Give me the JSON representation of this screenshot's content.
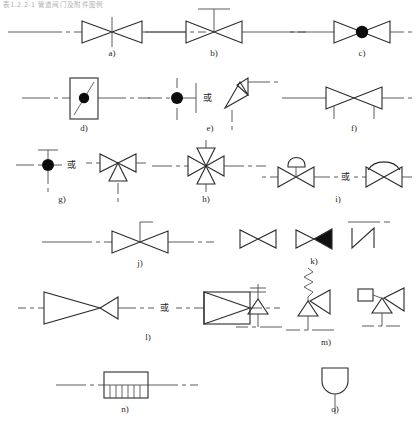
{
  "page": {
    "header_text": "表1.2.2-1  管道阀门及附件图例",
    "background": "#ffffff",
    "line_color": "#4a4a4a",
    "symbol_color": "#2b2b2b",
    "fill_color": "#111111",
    "width": 416,
    "height": 428
  },
  "or_label": "或",
  "items": [
    {
      "key": "a",
      "caption": "a)",
      "symbol_name": "globe-valve-plain",
      "description": "双三角阀门符号，中心交叉，带竖向阀杆线",
      "has_or": false,
      "variants": 1
    },
    {
      "key": "b",
      "caption": "b)",
      "symbol_name": "gate-valve-with-handwheel-stem",
      "description": "双三角阀门，顶部竖杆加横向手轮横线（T形）",
      "has_or": false,
      "variants": 1
    },
    {
      "key": "c",
      "caption": "c)",
      "symbol_name": "valve-with-solid-circle-center",
      "description": "双三角阀门，中心为实心圆点",
      "has_or": false,
      "variants": 1
    },
    {
      "key": "d",
      "caption": "d)",
      "symbol_name": "rectangular-body-valve-with-disc",
      "description": "竖长方形阀体，内有斜线与实心圆点",
      "has_or": false,
      "variants": 1
    },
    {
      "key": "e",
      "caption": "e)",
      "symbol_name": "plug-valve-or-angle-valve",
      "description": "实心圆点配竖杆与竖线 或 直角转角阀（两三角成直角）",
      "has_or": true,
      "variants": 2
    },
    {
      "key": "f",
      "caption": "f)",
      "symbol_name": "valve-with-two-down-legs",
      "description": "双三角阀门，下方两条短竖腿",
      "has_or": false,
      "variants": 1
    },
    {
      "key": "g",
      "caption": "g)",
      "symbol_name": "tee-stem-solid-dot-or-three-way-valve",
      "description": "T形杆加实心圆点 或 三通阀（上双三角下三角）",
      "has_or": true,
      "variants": 2
    },
    {
      "key": "h",
      "caption": "h)",
      "symbol_name": "four-way-valve",
      "description": "四通阀，四个三角在中心汇合",
      "has_or": false,
      "variants": 1
    },
    {
      "key": "i",
      "caption": "i)",
      "symbol_name": "diaphragm-valve-or-arc-valve",
      "description": "带半圆膜头的双三角阀 或 顶部弧线的双三角阀",
      "has_or": true,
      "variants": 2
    },
    {
      "key": "j",
      "caption": "j)",
      "symbol_name": "valve-with-l-shaped-stem",
      "description": "双三角阀门，顶部L形折杆",
      "has_or": false,
      "variants": 1
    },
    {
      "key": "k",
      "caption": "k)",
      "symbol_name": "blank-and-solid-and-z-symbols",
      "description": "空心蝶形、右三角填实的蝶形、Z形折线符号",
      "has_or": false,
      "variants": 3
    },
    {
      "key": "l",
      "caption": "l)",
      "symbol_name": "check-valve-or-boxed-triangle",
      "description": "大小三角组成的止回阀 或 矩形框内三角",
      "has_or": true,
      "variants": 2
    },
    {
      "key": "m",
      "caption": "m)",
      "symbol_name": "safety-valve-variants",
      "description": "重锤式安全阀、弹簧式安全阀、先导式安全阀",
      "has_or": false,
      "variants": 3
    },
    {
      "key": "n",
      "caption": "n)",
      "symbol_name": "strainer-filter",
      "description": "矩形过滤器，下半部竖向密排网格线",
      "has_or": false,
      "variants": 1
    },
    {
      "key": "o",
      "caption": "o)",
      "symbol_name": "u-shaped-cap-end",
      "description": "U形（下圆顶）封头，接一竖管",
      "has_or": false,
      "variants": 1
    }
  ]
}
